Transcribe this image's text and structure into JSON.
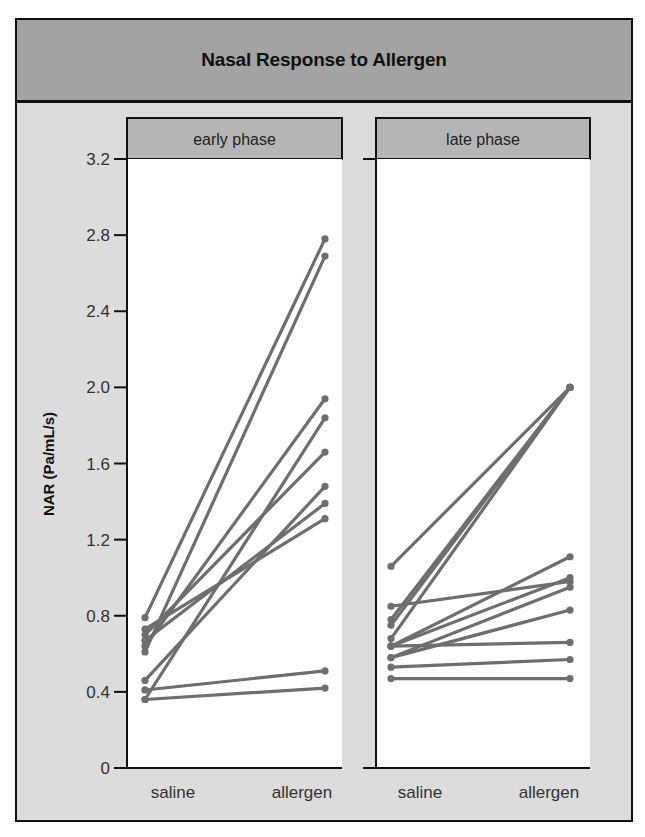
{
  "title": "Nasal Response to Allergen",
  "y_axis": {
    "label": "NAR (Pa/mL/s)",
    "ticks": [
      "0",
      "0.4",
      "0.8",
      "1.2",
      "1.6",
      "2.0",
      "2.4",
      "2.8",
      "3.2"
    ]
  },
  "panels": [
    {
      "label": "early phase",
      "x_categories": [
        "saline",
        "allergen"
      ]
    },
    {
      "label": "late phase",
      "x_categories": [
        "saline",
        "allergen"
      ]
    }
  ],
  "colors": {
    "line": "#6e6e6e",
    "title_bar": "#a3a3a3",
    "strip": "#b5b5b5",
    "background": "#dcdcdc",
    "plot_area": "#ffffff"
  },
  "chart_data": {
    "type": "line",
    "title": "Nasal Response to Allergen",
    "xlabel": "",
    "ylabel": "NAR (Pa/mL/s)",
    "ylim": [
      0,
      3.2
    ],
    "yticks": [
      0,
      0.4,
      0.8,
      1.2,
      1.6,
      2.0,
      2.4,
      2.8,
      3.2
    ],
    "grid": false,
    "legend": null,
    "categories": [
      "saline",
      "allergen"
    ],
    "facets": [
      {
        "label": "early phase",
        "pairs": [
          [
            0.79,
            2.78
          ],
          [
            0.61,
            2.69
          ],
          [
            0.64,
            1.94
          ],
          [
            0.36,
            1.84
          ],
          [
            0.7,
            1.66
          ],
          [
            0.46,
            1.48
          ],
          [
            0.67,
            1.39
          ],
          [
            0.73,
            1.31
          ],
          [
            0.41,
            0.51
          ],
          [
            0.36,
            0.42
          ]
        ]
      },
      {
        "label": "late phase",
        "pairs": [
          [
            1.06,
            2.0
          ],
          [
            0.75,
            2.0
          ],
          [
            0.68,
            2.0
          ],
          [
            0.78,
            2.0
          ],
          [
            0.85,
            0.98
          ],
          [
            0.64,
            1.11
          ],
          [
            0.64,
            1.0
          ],
          [
            0.58,
            0.95
          ],
          [
            0.58,
            0.83
          ],
          [
            0.64,
            0.66
          ],
          [
            0.53,
            0.57
          ],
          [
            0.47,
            0.47
          ]
        ]
      }
    ]
  }
}
